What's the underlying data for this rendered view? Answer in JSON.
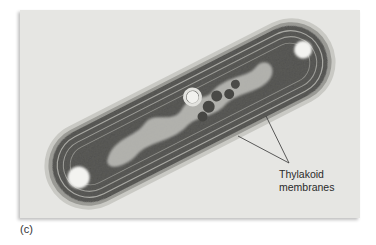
{
  "figure": {
    "panel_label": "(c)",
    "annotation": {
      "line1": "Thylakoid",
      "line2": "membranes"
    },
    "colors": {
      "background": "#e7e7e5",
      "cell_wall": "#b9b9b5",
      "cytoplasm": "#5a5a58",
      "granules": "#3f3f3d",
      "vacuole": "#f2f2f0",
      "leader_line": "#333333"
    }
  }
}
